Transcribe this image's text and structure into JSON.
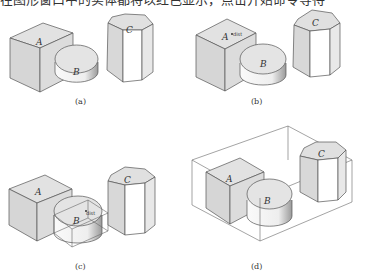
{
  "document": {
    "top_text": "在图形窗口中的实体都将以红色显示，点击开始命令等待",
    "figures": [
      {
        "id": "a",
        "caption": "(a)",
        "labels": [
          "A",
          "B",
          "C"
        ]
      },
      {
        "id": "b",
        "caption": "(b)",
        "labels": [
          "A",
          "B",
          "C"
        ],
        "cursor_tip": "dist"
      },
      {
        "id": "c",
        "caption": "(c)",
        "labels": [
          "A",
          "B",
          "C"
        ],
        "cursor_tip": "dist"
      },
      {
        "id": "d",
        "caption": "(d)",
        "labels": [
          "A",
          "B",
          "C"
        ]
      }
    ]
  },
  "colors": {
    "face_gray": "#d9d9d9",
    "face_light": "#ececec",
    "face_white": "#ffffff",
    "edge": "#555555",
    "bbox": "#666666"
  }
}
